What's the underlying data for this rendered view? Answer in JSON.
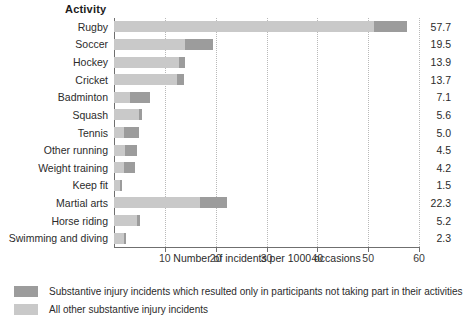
{
  "header": {
    "category_column_title": "Activity"
  },
  "chart_data": {
    "type": "bar",
    "orientation": "horizontal",
    "stacked": true,
    "title": "",
    "xlabel": "Number of incidents per 1000 occasions",
    "ylabel": "Activity",
    "xlim": [
      0,
      60
    ],
    "xticks": [
      10,
      20,
      30,
      40,
      50,
      60
    ],
    "grid": true,
    "legend_position": "bottom-left",
    "categories": [
      "Rugby",
      "Soccer",
      "Hockey",
      "Cricket",
      "Badminton",
      "Squash",
      "Tennis",
      "Other running",
      "Weight training",
      "Keep fit",
      "Martial arts",
      "Horse riding",
      "Swimming and diving"
    ],
    "totals": [
      57.7,
      19.5,
      13.9,
      13.7,
      7.1,
      5.6,
      5.0,
      4.5,
      4.2,
      1.5,
      22.3,
      5.2,
      2.3
    ],
    "series": [
      {
        "name": "All other substantive injury incidents",
        "color": "#c9c9c9",
        "values": [
          51.2,
          14.0,
          12.7,
          12.3,
          3.2,
          5.0,
          2.0,
          2.2,
          1.9,
          1.1,
          17.0,
          4.5,
          1.9
        ]
      },
      {
        "name": "Substantive injury incidents which resulted only in participants not taking part in their activities",
        "color": "#9c9c9c",
        "values": [
          6.5,
          5.5,
          1.2,
          1.4,
          3.9,
          0.6,
          3.0,
          2.3,
          2.3,
          0.4,
          5.3,
          0.7,
          0.4
        ]
      }
    ],
    "value_labels": [
      "57.7",
      "19.5",
      "13.9",
      "13.7",
      "7.1",
      "5.6",
      "5.0",
      "4.5",
      "4.2",
      "1.5",
      "22.3",
      "5.2",
      "2.3"
    ]
  },
  "legend": {
    "items": [
      {
        "label": "Substantive injury incidents which resulted only in participants not taking part in their activities",
        "color": "#9c9c9c"
      },
      {
        "label": "All other substantive injury incidents",
        "color": "#c9c9c9"
      }
    ]
  }
}
